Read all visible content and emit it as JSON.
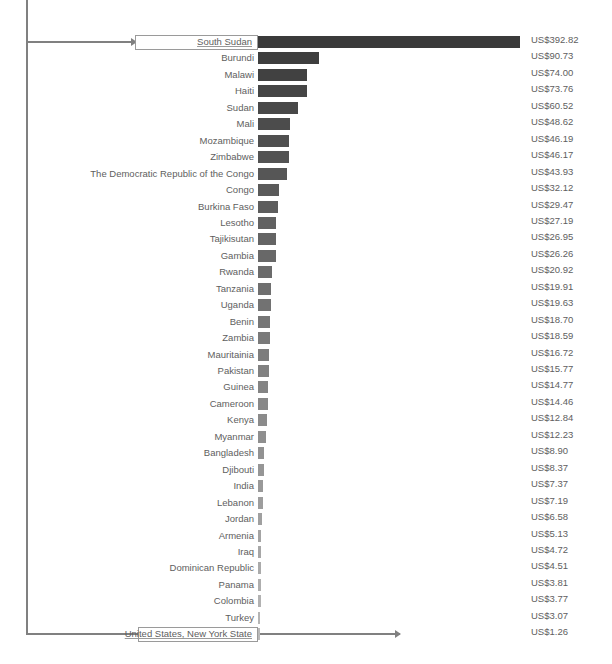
{
  "chart_data": {
    "type": "bar",
    "title": "",
    "xlabel": "",
    "ylabel": "",
    "orientation": "horizontal",
    "grid": false,
    "legend": false,
    "value_prefix": "US$",
    "xlim": [
      0,
      392.82
    ],
    "categories": [
      "South Sudan",
      "Burundi",
      "Malawi",
      "Haiti",
      "Sudan",
      "Mali",
      "Mozambique",
      "Zimbabwe",
      "The Democratic Republic of the Congo",
      "Congo",
      "Burkina Faso",
      "Lesotho",
      "Tajikisutan",
      "Gambia",
      "Rwanda",
      "Tanzania",
      "Uganda",
      "Benin",
      "Zambia",
      "Mauritainia",
      "Pakistan",
      "Guinea",
      "Cameroon",
      "Kenya",
      "Myanmar",
      "Bangladesh",
      "Djibouti",
      "India",
      "Lebanon",
      "Jordan",
      "Armenia",
      "Iraq",
      "Dominican Republic",
      "Panama",
      "Colombia",
      "Turkey",
      "United States, New York State"
    ],
    "values": [
      392.82,
      90.73,
      74.0,
      73.76,
      60.52,
      48.62,
      46.19,
      46.17,
      43.93,
      32.12,
      29.47,
      27.19,
      26.95,
      26.26,
      20.92,
      19.91,
      19.63,
      18.7,
      18.59,
      16.72,
      15.77,
      14.77,
      14.46,
      12.84,
      12.23,
      8.9,
      8.37,
      7.37,
      7.19,
      6.58,
      5.13,
      4.72,
      4.51,
      3.81,
      3.77,
      3.07,
      1.26
    ],
    "value_labels": [
      "US$392.82",
      "US$90.73",
      "US$74.00",
      "US$73.76",
      "US$60.52",
      "US$48.62",
      "US$46.19",
      "US$46.17",
      "US$43.93",
      "US$32.12",
      "US$29.47",
      "US$27.19",
      "US$26.95",
      "US$26.26",
      "US$20.92",
      "US$19.91",
      "US$19.63",
      "US$18.70",
      "US$18.59",
      "US$16.72",
      "US$15.77",
      "US$14.77",
      "US$14.46",
      "US$12.84",
      "US$12.23",
      "US$8.90",
      "US$8.37",
      "US$7.37",
      "US$7.19",
      "US$6.58",
      "US$5.13",
      "US$4.72",
      "US$4.51",
      "US$3.81",
      "US$3.77",
      "US$3.07",
      "US$1.26"
    ],
    "highlighted": [
      "South Sudan",
      "United States, New York State"
    ],
    "bar_color_start": "#3a3a3a",
    "bar_color_end": "#b9b9b9",
    "text_color": "#5e5e5e",
    "connector_color": "#808080"
  }
}
